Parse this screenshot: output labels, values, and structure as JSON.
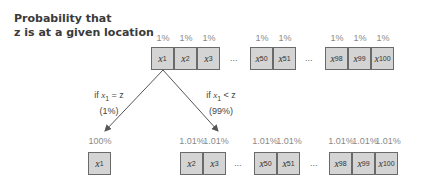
{
  "title_lines": [
    "Probability that",
    "z is at a given location"
  ],
  "top_row": {
    "percents": [
      "1%",
      "1%",
      "1%",
      "1%",
      "1%",
      "1%",
      "1%",
      "1%"
    ],
    "cells": [
      {
        "var": "x",
        "sub": "1"
      },
      {
        "var": "x",
        "sub": "2"
      },
      {
        "var": "x",
        "sub": "3"
      },
      {
        "var": "x",
        "sub": "50"
      },
      {
        "var": "x",
        "sub": "51"
      },
      {
        "var": "x",
        "sub": "98"
      },
      {
        "var": "x",
        "sub": "99"
      },
      {
        "var": "x",
        "sub": "100"
      }
    ],
    "ellipsis": "..."
  },
  "branches": {
    "left": {
      "line1_prefix": "if ",
      "var": "x",
      "sub": "1",
      "line1_suffix": " = z",
      "line2": "(1%)"
    },
    "right": {
      "line1_prefix": "if ",
      "var": "x",
      "sub": "1",
      "line1_suffix": " < z",
      "line2": "(99%)"
    }
  },
  "bottom_left": {
    "percent": "100%",
    "cell": {
      "var": "x",
      "sub": "1"
    }
  },
  "bottom_right": {
    "percents": [
      "1.01%",
      "1.01%",
      "1.01%",
      "1.01%",
      "1.01%",
      "1.01%",
      "1.01%"
    ],
    "cells": [
      {
        "var": "x",
        "sub": "2"
      },
      {
        "var": "x",
        "sub": "3"
      },
      {
        "var": "x",
        "sub": "50"
      },
      {
        "var": "x",
        "sub": "51"
      },
      {
        "var": "x",
        "sub": "98"
      },
      {
        "var": "x",
        "sub": "99"
      },
      {
        "var": "x",
        "sub": "100"
      }
    ],
    "ellipsis": "..."
  },
  "colors": {
    "cell_fill": "#d4d4d4",
    "cell_border": "#6a6a6a",
    "arrow": "#555555"
  }
}
